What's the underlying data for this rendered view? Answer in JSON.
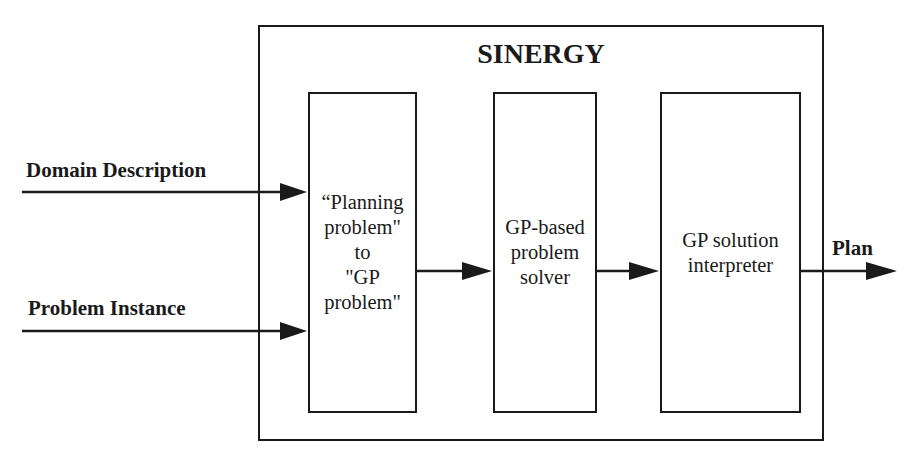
{
  "diagram": {
    "title": "SINERGY",
    "inputs": [
      {
        "label": "Domain Description"
      },
      {
        "label": "Problem Instance"
      }
    ],
    "boxes": [
      {
        "label": "“Planning\nproblem\"\nto\n\"GP\nproblem\""
      },
      {
        "label": "GP-based\nproblem\nsolver"
      },
      {
        "label": "GP solution\ninterpreter"
      }
    ],
    "output": {
      "label": "Plan"
    },
    "edges": [
      {
        "from": "Domain Description",
        "to": "box-1"
      },
      {
        "from": "Problem Instance",
        "to": "box-1"
      },
      {
        "from": "box-1",
        "to": "box-2"
      },
      {
        "from": "box-2",
        "to": "box-3"
      },
      {
        "from": "box-3",
        "to": "Plan"
      }
    ],
    "colors": {
      "stroke": "#1a1a1a",
      "background": "#ffffff"
    }
  }
}
